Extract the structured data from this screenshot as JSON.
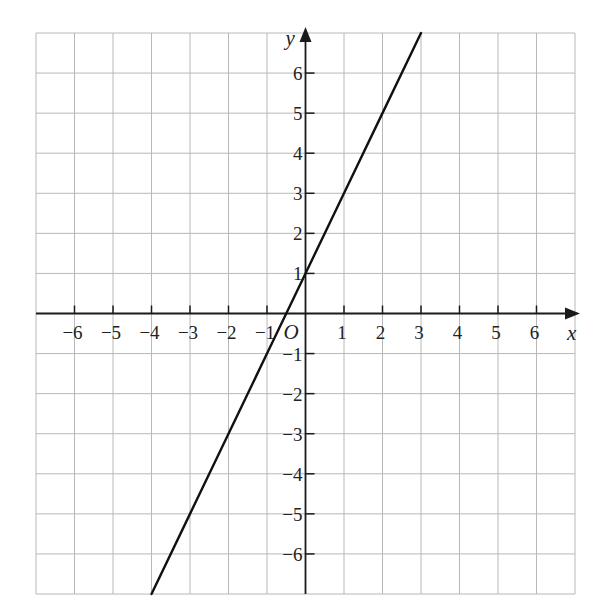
{
  "header": {
    "cropped_text": "…pleted graph…"
  },
  "chart_data": {
    "type": "line",
    "title": "",
    "xlabel": "x",
    "ylabel": "y",
    "origin_label": "O",
    "xlim": [
      -7,
      7
    ],
    "ylim": [
      -7,
      7
    ],
    "grid": true,
    "x_ticks": [
      -6,
      -5,
      -4,
      -3,
      -2,
      -1,
      1,
      2,
      3,
      4,
      5,
      6
    ],
    "y_ticks": [
      -6,
      -5,
      -4,
      -3,
      -2,
      -1,
      1,
      2,
      3,
      4,
      5,
      6
    ],
    "x_tick_labels": [
      "−6",
      "−5",
      "−4",
      "−3",
      "−2",
      "−1",
      "1",
      "2",
      "3",
      "4",
      "5",
      "6"
    ],
    "y_tick_labels": [
      "−6",
      "−5",
      "−4",
      "−3",
      "−2",
      "−1",
      "1",
      "2",
      "3",
      "4",
      "5",
      "6"
    ],
    "series": [
      {
        "name": "y = 2x + 1",
        "x": [
          -4,
          -3,
          -2,
          -1,
          0,
          1,
          2,
          3
        ],
        "y": [
          -7,
          -5,
          -3,
          -1,
          1,
          3,
          5,
          7
        ]
      }
    ],
    "legend": null
  },
  "style": {
    "grid_color": "#b8b8b8",
    "axis_color": "#1a1a1a",
    "line_color": "#111111",
    "background": "#ffffff"
  }
}
